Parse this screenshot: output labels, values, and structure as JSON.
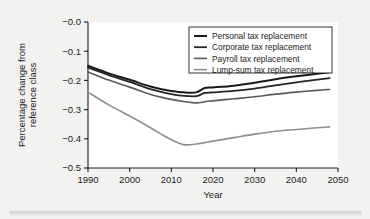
{
  "chart_data": {
    "type": "line",
    "title": "",
    "xlabel": "Year",
    "ylabel": "Percentage change from reference class",
    "ylabel_line1": "Percentage change from",
    "ylabel_line2": "reference class",
    "xlim": [
      1990,
      2050
    ],
    "ylim": [
      -0.5,
      0.0
    ],
    "xticks": [
      1990,
      2000,
      2010,
      2020,
      2030,
      2040,
      2050
    ],
    "xticklabels": [
      "1990",
      "2000",
      "2010",
      "2020",
      "2030",
      "2040",
      "2050"
    ],
    "yticks": [
      0.0,
      -0.1,
      -0.2,
      -0.3,
      -0.4,
      -0.5
    ],
    "yticklabels": [
      "−0.0",
      "−0.1",
      "−0.2",
      "−0.3",
      "−0.4",
      "−0.5"
    ],
    "grid": false,
    "legend_position": "upper right",
    "x": [
      1990,
      1995,
      2000,
      2005,
      2008,
      2010,
      2013,
      2016,
      2018,
      2020,
      2025,
      2030,
      2035,
      2040,
      2045,
      2048
    ],
    "series": [
      {
        "name": "Personal tax replacement",
        "color": "#1a1a1a",
        "width": 2.0,
        "values": [
          -0.15,
          -0.176,
          -0.198,
          -0.221,
          -0.231,
          -0.236,
          -0.241,
          -0.241,
          -0.226,
          -0.224,
          -0.218,
          -0.208,
          -0.196,
          -0.186,
          -0.177,
          -0.172
        ]
      },
      {
        "name": "Corporate tax replacement",
        "color": "#262626",
        "width": 1.8,
        "values": [
          -0.156,
          -0.182,
          -0.205,
          -0.23,
          -0.241,
          -0.247,
          -0.253,
          -0.254,
          -0.243,
          -0.241,
          -0.236,
          -0.228,
          -0.217,
          -0.207,
          -0.197,
          -0.192
        ]
      },
      {
        "name": "Payroll tax replacement",
        "color": "#5a5a5a",
        "width": 1.6,
        "values": [
          -0.171,
          -0.199,
          -0.223,
          -0.248,
          -0.259,
          -0.265,
          -0.272,
          -0.277,
          -0.273,
          -0.27,
          -0.263,
          -0.256,
          -0.247,
          -0.24,
          -0.234,
          -0.231
        ]
      },
      {
        "name": "Lump-sum tax replacement",
        "color": "#8f8f8f",
        "width": 1.6,
        "values": [
          -0.24,
          -0.284,
          -0.322,
          -0.362,
          -0.388,
          -0.403,
          -0.42,
          -0.418,
          -0.413,
          -0.408,
          -0.396,
          -0.384,
          -0.374,
          -0.368,
          -0.362,
          -0.359
        ]
      }
    ]
  },
  "legend": {
    "entries": [
      "Personal tax replacement",
      "Corporate tax replacement",
      "Payroll tax replacement",
      "Lump-sum tax replacement"
    ]
  },
  "colors": {
    "background": "#f2f2f1",
    "plot_background": "#ffffff",
    "axis": "#1b1b1b",
    "series_1": "#1a1a1a",
    "series_2": "#262626",
    "series_3": "#5a5a5a",
    "series_4": "#8f8f8f"
  }
}
